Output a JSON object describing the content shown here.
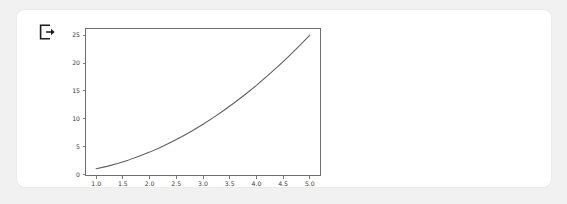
{
  "card": {
    "background_color": "#ffffff",
    "border_color": "#ebebeb"
  },
  "page": {
    "background_color": "#f1f1f1"
  },
  "toolbar": {
    "export_icon_name": "export-icon",
    "export_icon_label": "Export"
  },
  "chart_data": {
    "type": "line",
    "title": "",
    "xlabel": "",
    "ylabel": "",
    "grid": false,
    "legend": false,
    "line_color": "#5c5c5c",
    "axes_color": "#6e6e6e",
    "xlim": [
      0.8,
      5.2
    ],
    "ylim": [
      -0.2,
      26.2
    ],
    "xticks": [
      1.0,
      1.5,
      2.0,
      2.5,
      3.0,
      3.5,
      4.0,
      4.5,
      5.0
    ],
    "xtick_labels": [
      "1.0",
      "1.5",
      "2.0",
      "2.5",
      "3.0",
      "3.5",
      "4.0",
      "4.5",
      "5.0"
    ],
    "yticks": [
      0,
      5,
      10,
      15,
      20,
      25
    ],
    "ytick_labels": [
      "0",
      "5",
      "10",
      "15",
      "20",
      "25"
    ],
    "series": [
      {
        "name": "y = x^2",
        "x": [
          1.0,
          1.2,
          1.4,
          1.6,
          1.8,
          2.0,
          2.2,
          2.4,
          2.6,
          2.8,
          3.0,
          3.2,
          3.4,
          3.6,
          3.8,
          4.0,
          4.2,
          4.4,
          4.6,
          4.8,
          5.0
        ],
        "y": [
          1.0,
          1.44,
          1.96,
          2.56,
          3.24,
          4.0,
          4.84,
          5.76,
          6.76,
          7.84,
          9.0,
          10.24,
          11.56,
          12.96,
          14.44,
          16.0,
          17.64,
          19.36,
          21.16,
          23.04,
          25.0
        ]
      }
    ]
  }
}
